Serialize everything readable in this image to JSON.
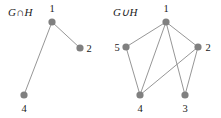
{
  "figure": {
    "width": 221,
    "height": 118,
    "background": "#ffffff",
    "node_color": "#808080",
    "edge_color": "#8a8a8a",
    "text_color": "#1a1a1a",
    "node_radius": 3.6,
    "edge_width": 0.9
  },
  "graphs": [
    {
      "id": "intersection",
      "caption": "G∩H",
      "caption_x": 8,
      "caption_y": 16,
      "nodes": [
        {
          "id": "1",
          "label": "1",
          "x": 52,
          "y": 22,
          "label_x": 52,
          "label_y": 12
        },
        {
          "id": "2",
          "label": "2",
          "x": 80,
          "y": 48,
          "label_x": 89,
          "label_y": 52
        },
        {
          "id": "4",
          "label": "4",
          "x": 24,
          "y": 95,
          "label_x": 24,
          "label_y": 112
        }
      ],
      "edges": [
        {
          "from": "1",
          "to": "2"
        },
        {
          "from": "1",
          "to": "4"
        }
      ]
    },
    {
      "id": "union",
      "caption": "G∪H",
      "caption_x": 113,
      "caption_y": 16,
      "nodes": [
        {
          "id": "1",
          "label": "1",
          "x": 166,
          "y": 22,
          "label_x": 166,
          "label_y": 12
        },
        {
          "id": "5",
          "label": "5",
          "x": 126,
          "y": 47,
          "label_x": 117,
          "label_y": 51
        },
        {
          "id": "2",
          "label": "2",
          "x": 198,
          "y": 47,
          "label_x": 208,
          "label_y": 51
        },
        {
          "id": "4",
          "label": "4",
          "x": 140,
          "y": 95,
          "label_x": 140,
          "label_y": 112
        },
        {
          "id": "3",
          "label": "3",
          "x": 185,
          "y": 95,
          "label_x": 185,
          "label_y": 112
        }
      ],
      "edges": [
        {
          "from": "1",
          "to": "5"
        },
        {
          "from": "1",
          "to": "4"
        },
        {
          "from": "1",
          "to": "3"
        },
        {
          "from": "1",
          "to": "2"
        },
        {
          "from": "5",
          "to": "4"
        },
        {
          "from": "2",
          "to": "4"
        },
        {
          "from": "2",
          "to": "3"
        }
      ]
    }
  ]
}
